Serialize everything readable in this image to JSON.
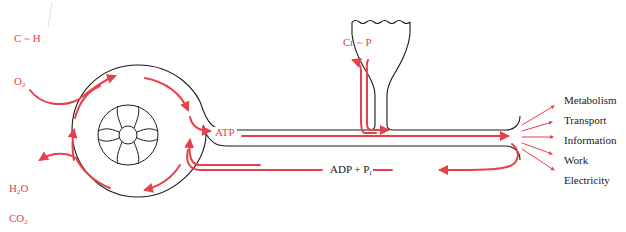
{
  "colors": {
    "flow": "#e8404a",
    "outline": "#1a1a1a",
    "background": "#ffffff"
  },
  "inputs": {
    "fuel": "C ~ H",
    "oxygen": {
      "base": "O",
      "sub": "2"
    }
  },
  "outputs": {
    "water": {
      "base": "H",
      "sub": "2",
      "tail": "O"
    },
    "carbon_dioxide": {
      "base": "CO",
      "sub": "2"
    }
  },
  "reservoir": {
    "label": "Cr ~ P"
  },
  "pipe": {
    "atp_label": "ATP",
    "adp_label": {
      "base": "ADP + P",
      "sub": "i"
    }
  },
  "uses": [
    {
      "label": "Metabolism"
    },
    {
      "label": "Transport"
    },
    {
      "label": "Information"
    },
    {
      "label": "Work"
    },
    {
      "label": "Electricity"
    }
  ]
}
